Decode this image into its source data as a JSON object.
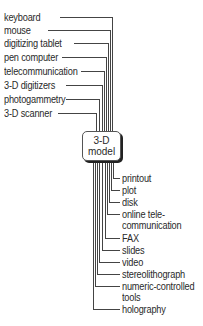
{
  "diagram": {
    "center": {
      "line1": "3-D",
      "line2": "model"
    },
    "inputs": [
      {
        "label": "keyboard"
      },
      {
        "label": "mouse"
      },
      {
        "label": "digitizing tablet"
      },
      {
        "label": "pen computer"
      },
      {
        "label": "telecommunication"
      },
      {
        "label": "3-D digitizers"
      },
      {
        "label": "photogammetry"
      },
      {
        "label": "3-D scanner"
      }
    ],
    "outputs": [
      {
        "label": "printout"
      },
      {
        "label": "plot"
      },
      {
        "label": "disk"
      },
      {
        "label": "online tele-",
        "label2": "communication"
      },
      {
        "label": "FAX"
      },
      {
        "label": "slides"
      },
      {
        "label": "video"
      },
      {
        "label": "stereolithograph"
      },
      {
        "label": "numeric-controlled",
        "label2": "tools"
      },
      {
        "label": "holography"
      }
    ],
    "colors": {
      "line": "#444444",
      "text": "#2a2a2a"
    }
  }
}
